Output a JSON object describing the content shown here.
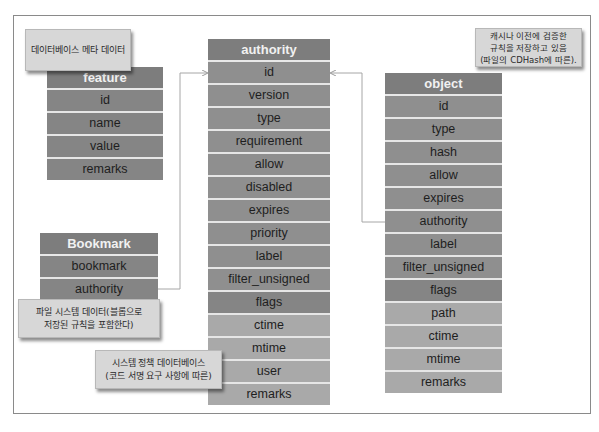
{
  "callouts": {
    "meta": "데이터베이스 메타 데이터",
    "object_cache": [
      "캐시나 이전에 검증한",
      "규칙을 저장하고 있음",
      "(파일의 CDHash에 따른)."
    ],
    "filesystem": [
      "파일 시스템 데이터(블롭으로",
      "저장된 규칙을 포함한다)"
    ],
    "system_policy": [
      "시스템 정책 데이터베이스",
      "(코드 서명 요구 사항에 따른)"
    ]
  },
  "tables": {
    "feature": {
      "title": "feature",
      "fields": [
        "id",
        "name",
        "value",
        "remarks"
      ]
    },
    "bookmark": {
      "title": "Bookmark",
      "fields": [
        "bookmark",
        "authority"
      ]
    },
    "authority": {
      "title": "authority",
      "fields": [
        "id",
        "version",
        "type",
        "requirement",
        "allow",
        "disabled",
        "expires",
        "priority",
        "label",
        "filter_unsigned",
        "flags",
        "ctime",
        "mtime",
        "user",
        "remarks"
      ]
    },
    "object": {
      "title": "object",
      "fields": [
        "id",
        "type",
        "hash",
        "allow",
        "expires",
        "authority",
        "label",
        "filter_unsigned",
        "flags",
        "path",
        "ctime",
        "mtime",
        "remarks"
      ]
    }
  },
  "relations": [
    {
      "from": "Bookmark.authority",
      "to": "authority.id"
    },
    {
      "from": "object.authority",
      "to": "authority.id"
    }
  ],
  "colors": {
    "header": "#7d7d7d",
    "row": "#8f8f8f",
    "row_light": "#a9a9a9",
    "callout": "#d7d7d7",
    "connector": "#a0a0a0"
  }
}
